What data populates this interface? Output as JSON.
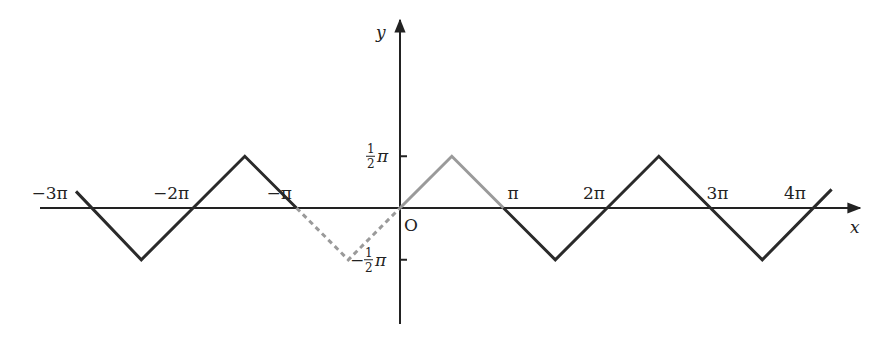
{
  "chart_data": {
    "type": "line",
    "title": "",
    "xlabel": "x",
    "ylabel": "y",
    "origin_label": "O",
    "x_ticks": [
      {
        "value": -3,
        "label": "−3π"
      },
      {
        "value": -2,
        "label": "−2π"
      },
      {
        "value": -1,
        "label": "−π"
      },
      {
        "value": 1,
        "label": "π"
      },
      {
        "value": 2,
        "label": "2π"
      },
      {
        "value": 3,
        "label": "3π"
      },
      {
        "value": 4,
        "label": "4π"
      }
    ],
    "y_ticks": [
      {
        "value": 0.5,
        "label": "½π",
        "num": "1",
        "den": "2"
      },
      {
        "value": -0.5,
        "label": "−½π",
        "num": "1",
        "den": "2"
      }
    ],
    "units": "multiples of π",
    "xlim": [
      -3.45,
      4.35
    ],
    "ylim": [
      -0.78,
      0.95
    ],
    "grid": false,
    "legend": null,
    "series": [
      {
        "name": "periodic triangle wave (black)",
        "color": "#2a2a2a",
        "style": "solid",
        "x": [
          -3.13,
          -2.5,
          -1.5,
          -1.0
        ],
        "y": [
          0.16,
          -0.5,
          0.5,
          0.0
        ]
      },
      {
        "name": "reflected segment (gray dashed)",
        "color": "#9a9a9a",
        "style": "dashed",
        "x": [
          -1.0,
          -0.5,
          0.0
        ],
        "y": [
          0.0,
          -0.5,
          0.0
        ]
      },
      {
        "name": "base segment (gray solid)",
        "color": "#9a9a9a",
        "style": "solid",
        "x": [
          0.0,
          0.5,
          1.0
        ],
        "y": [
          0.0,
          0.5,
          0.0
        ]
      },
      {
        "name": "periodic triangle wave continuation (black)",
        "color": "#2a2a2a",
        "style": "solid",
        "x": [
          1.0,
          1.5,
          2.5,
          3.5,
          4.17
        ],
        "y": [
          0.0,
          -0.5,
          0.5,
          -0.5,
          0.18
        ]
      }
    ]
  },
  "layout": {
    "origin_px": [
      400,
      208
    ],
    "pi_px": 103.5,
    "axis_x_range_px": [
      40,
      860
    ],
    "axis_y_range_px": [
      324,
      20
    ]
  }
}
